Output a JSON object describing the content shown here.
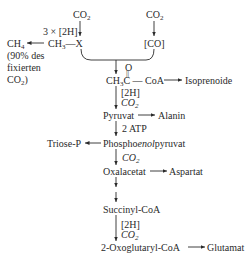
{
  "top": {
    "co2_left": "CO",
    "co2_right": "CO",
    "reductant": "3 × [2H]",
    "methyl_x": "CH",
    "methyl_x_suffix": "—X",
    "carbon_monoxide": "[CO]",
    "methane": "CH",
    "methane_note_1": "(90% des",
    "methane_note_2": "fixierten",
    "methane_note_3": "CO"
  },
  "acetyl": {
    "oxygen": "O",
    "double_bond": "||",
    "label_a": "CH",
    "label_b": "C — CoA",
    "product": "Isoprenoide"
  },
  "steps": {
    "s1_a": "[2H]",
    "s1_b": "CO",
    "pyruvat": "Pyruvat",
    "alanin": "Alanin",
    "s2": "2 ATP",
    "triose": "Triose-P",
    "pep_a": "Phospho",
    "pep_b": "enol",
    "pep_c": "pyruvat",
    "s3": "CO",
    "oxalacetat": "Oxalacetat",
    "aspartat": "Aspartat",
    "succinyl": "Succinyl-CoA",
    "s4_a": "[2H]",
    "s4_b": "CO",
    "oxoglutaryl": "2-Oxoglutaryl-CoA",
    "glutamat": "Glutamat"
  },
  "subscripts": {
    "two": "2",
    "three": "3",
    "four": "4"
  }
}
